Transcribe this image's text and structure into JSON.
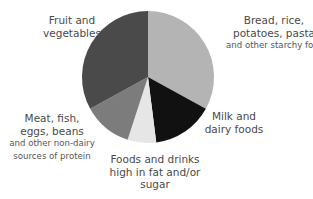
{
  "chart_data": {
    "type": "pie",
    "title": "",
    "start_angle_deg": 0,
    "direction": "clockwise",
    "slices": [
      {
        "name": "Bread, rice, potatoes, pasta and other starchy foods",
        "value": 33,
        "color": "#b4b4b4"
      },
      {
        "name": "Milk and dairy foods",
        "value": 15,
        "color": "#111111"
      },
      {
        "name": "Foods and drinks high in fat and/or sugar",
        "value": 7,
        "color": "#e6e6e6"
      },
      {
        "name": "Meat, fish, eggs, beans and other non-dairy sources of protein",
        "value": 12,
        "color": "#7c7c7c"
      },
      {
        "name": "Fruit and vegetables",
        "value": 33,
        "color": "#4a4a4a"
      }
    ]
  },
  "labels": {
    "fruit": {
      "line1": "Fruit and",
      "line2": "vegetables"
    },
    "bread": {
      "line1": "Bread, rice,",
      "line2": "potatoes, pasta",
      "line3": "and other starchy foods"
    },
    "milk": {
      "line1": "Milk and",
      "line2": "dairy foods"
    },
    "meat": {
      "line1": "Meat, fish,",
      "line2": "eggs, beans",
      "line3": "and other non-dairy",
      "line4": "sources of protein"
    },
    "fat": {
      "line1": "Foods and drinks",
      "line2": "high in fat and/or",
      "line3": "sugar"
    }
  }
}
